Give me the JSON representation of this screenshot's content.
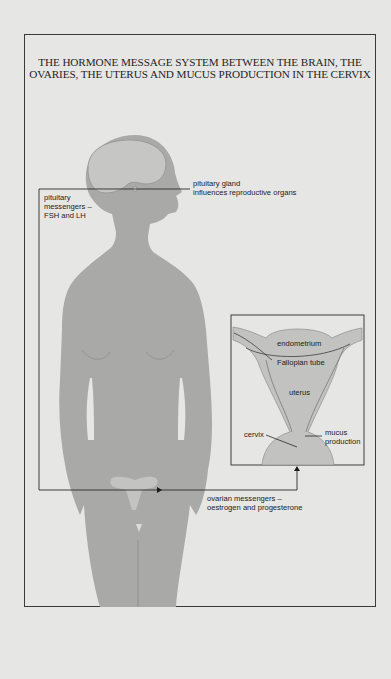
{
  "title": "THE HORMONE MESSAGE SYSTEM BETWEEN THE BRAIN, THE OVARIES, THE UTERUS AND MUCUS PRODUCTION IN THE CERVIX",
  "labels": {
    "pituitary_gland": "pituitary gland\ninfluences reproductive organs",
    "pituitary_messengers": "pituitary\nmessengers –\nFSH and LH",
    "ovarian_messengers": "ovarian messengers –\noestrogen and progesterone"
  },
  "uterus_inset": {
    "endometrium": "endometrium",
    "fallopian_tube": "Fallopian tube",
    "uterus": "uterus",
    "cervix": "cervix",
    "mucus_production": "mucus\nproduction"
  },
  "colors": {
    "background": "#e6e6e4",
    "body": "#a9a9a7",
    "brain": "#c6c6c4",
    "uterus": "#c3c3c1",
    "line": "#2a2a2a"
  }
}
